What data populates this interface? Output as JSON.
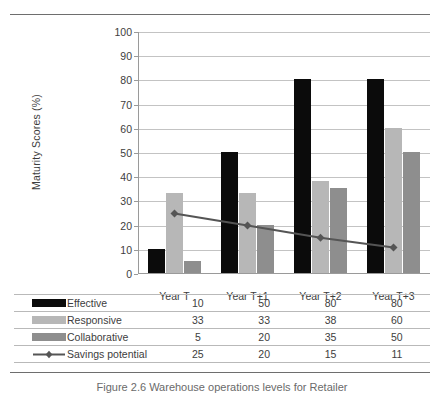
{
  "figure": {
    "caption": "Figure 2.6 Warehouse operations levels for Retailer"
  },
  "chart_data": {
    "type": "bar",
    "title": "",
    "xlabel": "",
    "ylabel": "Maturity  Scores (%)",
    "ylim": [
      0,
      100
    ],
    "ytick_step": 10,
    "yticks": [
      "100",
      "90",
      "80",
      "70",
      "60",
      "50",
      "40",
      "30",
      "20",
      "10",
      "0"
    ],
    "grid": true,
    "legend_position": "bottom-table",
    "categories": [
      "Year T",
      "Year T+1",
      "Year T+2",
      "Year T+3"
    ],
    "series": [
      {
        "name": "Effective",
        "type": "bar",
        "color": "#0b0b0b",
        "values": [
          10,
          50,
          80,
          80
        ]
      },
      {
        "name": "Responsive",
        "type": "bar",
        "color": "#b7b7b7",
        "values": [
          33,
          33,
          38,
          60
        ]
      },
      {
        "name": "Collaborative",
        "type": "bar",
        "color": "#8e8e8e",
        "values": [
          5,
          20,
          35,
          50
        ]
      },
      {
        "name": "Savings potential",
        "type": "line",
        "color": "#555555",
        "marker": "diamond",
        "values": [
          25,
          20,
          15,
          11
        ]
      }
    ]
  },
  "table": {
    "column_headers": [
      "Year T",
      "Year T+1",
      "Year T+2",
      "Year T+3"
    ],
    "rows": [
      {
        "label": "Effective",
        "swatch": "effective",
        "values": [
          "10",
          "50",
          "80",
          "80"
        ]
      },
      {
        "label": "Responsive",
        "swatch": "responsive",
        "values": [
          "33",
          "33",
          "38",
          "60"
        ]
      },
      {
        "label": "Collaborative",
        "swatch": "collaborative",
        "values": [
          "5",
          "20",
          "35",
          "50"
        ]
      },
      {
        "label": "Savings potential",
        "swatch": "line",
        "values": [
          "25",
          "20",
          "15",
          "11"
        ]
      }
    ]
  },
  "colors": {
    "effective": "#0b0b0b",
    "responsive": "#b7b7b7",
    "collaborative": "#8e8e8e",
    "savings_line": "#555555",
    "gridline": "#c3c3c3",
    "axis": "#9a9a9a",
    "rule": "#6e6e6e"
  }
}
